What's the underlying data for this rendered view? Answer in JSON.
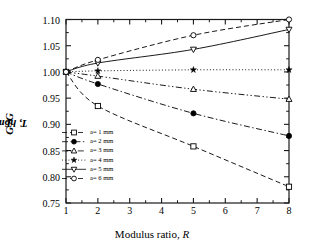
{
  "chart_data": {
    "type": "line",
    "title": "",
    "xlabel": "Modulus ratio, R",
    "ylabel": "G_T / G_T,homo",
    "ylabel_main": "G",
    "ylabel_sub1": "T",
    "ylabel_mid": " /G",
    "ylabel_sub2": "T, homo",
    "xlim": [
      1,
      8
    ],
    "ylim": [
      0.75,
      1.1
    ],
    "xticks": [
      1,
      2,
      3,
      4,
      5,
      6,
      7,
      8
    ],
    "yticks": [
      0.75,
      0.8,
      0.85,
      0.9,
      0.95,
      1.0,
      1.05,
      1.1
    ],
    "ytick_labels": [
      "0.75",
      "0.80",
      "0.85",
      "0.90",
      "0.95",
      "1.00",
      "1.05",
      "1.10"
    ],
    "xtick_labels": [
      "1",
      "2",
      "3",
      "4",
      "5",
      "6",
      "7",
      "8"
    ],
    "grid": false,
    "minor_ticks": true,
    "frame": "box",
    "legend_position": "lower-left-inside",
    "x": [
      1,
      2,
      5,
      8
    ],
    "series": [
      {
        "name": "a= 1 mm",
        "marker": "open-square",
        "linestyle": "dashed",
        "color": "#000000",
        "values": [
          1.0,
          0.935,
          0.858,
          0.781
        ]
      },
      {
        "name": "a= 2 mm",
        "marker": "filled-circle",
        "linestyle": "dash-dot",
        "color": "#000000",
        "values": [
          1.0,
          0.977,
          0.921,
          0.878
        ]
      },
      {
        "name": "a= 3 mm",
        "marker": "open-triangle-up",
        "linestyle": "dash-dot-dot",
        "color": "#000000",
        "values": [
          1.0,
          0.992,
          0.967,
          0.948
        ]
      },
      {
        "name": "a= 4 mm",
        "marker": "star",
        "linestyle": "dotted",
        "color": "#000000",
        "values": [
          1.0,
          1.002,
          1.004,
          1.004
        ]
      },
      {
        "name": "a= 5 mm",
        "marker": "open-triangle-down",
        "linestyle": "solid",
        "color": "#000000",
        "values": [
          1.0,
          1.017,
          1.043,
          1.081
        ]
      },
      {
        "name": "a= 6 mm",
        "marker": "open-circle",
        "linestyle": "dashed",
        "color": "#000000",
        "values": [
          1.0,
          1.023,
          1.07,
          1.1
        ]
      }
    ]
  }
}
